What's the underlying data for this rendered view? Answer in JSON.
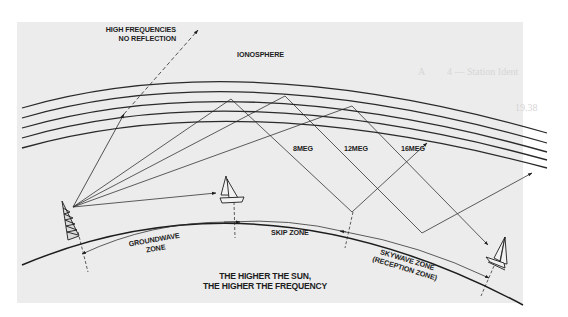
{
  "diagram": {
    "labels": {
      "high_freq_line1": "HIGH FREQUENCIES",
      "high_freq_line2": "NO REFLECTION",
      "ionosphere": "IONOSPHERE",
      "freq_8": "8MEG",
      "freq_12": "12MEG",
      "freq_16": "16MEG",
      "groundwave_line1": "GROUNDWAVE",
      "groundwave_line2": "ZONE",
      "skip_zone": "SKIP ZONE",
      "skywave_line1": "SKYWAVE ZONE",
      "skywave_line2": "(RECEPTION ZONE)",
      "caption_line1": "THE HIGHER THE SUN,",
      "caption_line2": "THE HIGHER THE FREQUENCY"
    },
    "elements": {
      "transmitter": "radio-tower-icon",
      "receiver_near": "sailboat-icon",
      "receiver_far": "sailboat-icon"
    },
    "bleed_through_text": [
      "4 — Station Ident",
      "19.38",
      "A"
    ],
    "colors": {
      "paper": "#ececec",
      "ink": "#1d1d1d",
      "background": "#ffffff"
    }
  }
}
